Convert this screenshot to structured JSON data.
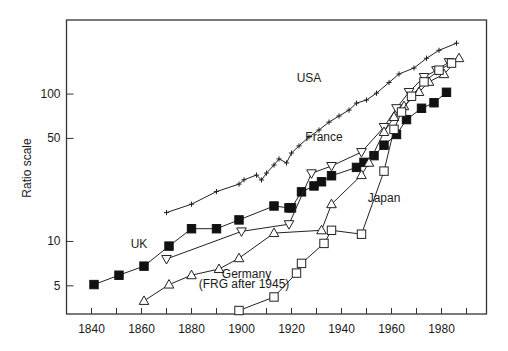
{
  "chart_data": {
    "type": "line",
    "title": "",
    "xlabel": "",
    "ylabel": "Ratio scale",
    "yscale": "log",
    "xlim": [
      1830,
      1998
    ],
    "ylim": [
      3.22,
      318
    ],
    "grid": false,
    "legend": "none (inline series labels)",
    "xticks": [
      1840,
      1860,
      1880,
      1900,
      1920,
      1940,
      1960,
      1980
    ],
    "xminor_step": 10,
    "yticks": [
      5,
      10,
      50,
      100
    ],
    "series": [
      {
        "name": "USA",
        "label": "USA",
        "marker": "cross",
        "points": [
          [
            1870,
            15.7
          ],
          [
            1880,
            17.9
          ],
          [
            1890,
            21.8
          ],
          [
            1899,
            24.5
          ],
          [
            1901,
            26.2
          ],
          [
            1906,
            28.2
          ],
          [
            1908,
            26.1
          ],
          [
            1910,
            29.1
          ],
          [
            1913,
            33.0
          ],
          [
            1915,
            36.3
          ],
          [
            1918,
            34.1
          ],
          [
            1920,
            39.8
          ],
          [
            1923,
            44.5
          ],
          [
            1927,
            51.1
          ],
          [
            1931,
            57.0
          ],
          [
            1935,
            64.5
          ],
          [
            1939,
            71.0
          ],
          [
            1943,
            77.8
          ],
          [
            1946,
            86.8
          ],
          [
            1950,
            91.1
          ],
          [
            1954,
            101.4
          ],
          [
            1959,
            119.8
          ],
          [
            1963,
            136.8
          ],
          [
            1969,
            150.2
          ],
          [
            1974,
            174.9
          ],
          [
            1979,
            198.0
          ],
          [
            1986,
            221.4
          ]
        ]
      },
      {
        "name": "UK",
        "label": "UK",
        "marker": "filled-square",
        "points": [
          [
            1841,
            5.1
          ],
          [
            1851,
            5.9
          ],
          [
            1861,
            6.8
          ],
          [
            1871,
            9.3
          ],
          [
            1880,
            12.2
          ],
          [
            1890,
            12.2
          ],
          [
            1899,
            14.0
          ],
          [
            1913,
            17.4
          ],
          [
            1919,
            16.9
          ],
          [
            1920,
            16.9
          ],
          [
            1924,
            21.7
          ],
          [
            1929,
            23.8
          ],
          [
            1932,
            25.4
          ],
          [
            1936,
            27.9
          ],
          [
            1946,
            31.8
          ],
          [
            1949,
            34.4
          ],
          [
            1953,
            38.2
          ],
          [
            1957,
            45.0
          ],
          [
            1962,
            53.2
          ],
          [
            1966,
            67.1
          ],
          [
            1972,
            80.1
          ],
          [
            1977,
            87.3
          ],
          [
            1982,
            102.8
          ]
        ]
      },
      {
        "name": "France",
        "label": "France",
        "marker": "open-down-triangle",
        "points": [
          [
            1870,
            7.6
          ],
          [
            1900,
            11.7
          ],
          [
            1919,
            13.1
          ],
          [
            1928,
            29.0
          ],
          [
            1936,
            32.5
          ],
          [
            1948,
            40.4
          ],
          [
            1957,
            59.8
          ],
          [
            1962,
            80.2
          ],
          [
            1967,
            103.3
          ],
          [
            1973,
            130.5
          ],
          [
            1978,
            145.2
          ],
          [
            1983,
            164.7
          ]
        ]
      },
      {
        "name": "Germany",
        "label": "Germany",
        "label2": "(FRG after 1945)",
        "marker": "open-up-triangle",
        "points": [
          [
            1861,
            3.95
          ],
          [
            1871,
            5.1
          ],
          [
            1880,
            5.9
          ],
          [
            1891,
            6.5
          ],
          [
            1899,
            7.7
          ],
          [
            1913,
            11.4
          ],
          [
            1932,
            11.9
          ],
          [
            1936,
            17.9
          ],
          [
            1948,
            28.2
          ],
          [
            1951,
            34.2
          ],
          [
            1957,
            55.3
          ],
          [
            1961,
            69.9
          ],
          [
            1965,
            82.8
          ],
          [
            1971,
            103.3
          ],
          [
            1975,
            121.0
          ],
          [
            1981,
            136.5
          ],
          [
            1987,
            175.2
          ]
        ]
      },
      {
        "name": "Japan",
        "label": "Japan",
        "marker": "open-square",
        "points": [
          [
            1899,
            3.4
          ],
          [
            1913,
            4.2
          ],
          [
            1922,
            6.1
          ],
          [
            1924,
            7.1
          ],
          [
            1933,
            9.7
          ],
          [
            1936,
            11.9
          ],
          [
            1948,
            11.2
          ],
          [
            1957,
            30.0
          ],
          [
            1961,
            57.6
          ],
          [
            1964,
            75.5
          ],
          [
            1968,
            96.6
          ],
          [
            1973,
            121.0
          ],
          [
            1979,
            145.2
          ],
          [
            1984,
            162.2
          ]
        ]
      }
    ],
    "annotations": [
      {
        "text": "USA",
        "at": [
          1927,
          120
        ]
      },
      {
        "text": "France",
        "at": [
          1933,
          48
        ]
      },
      {
        "text": "UK",
        "at": [
          1859,
          9.0
        ]
      },
      {
        "text": "Japan",
        "at": [
          1957,
          18.5
        ]
      },
      {
        "text": "Germany",
        "at": [
          1902,
          5.65
        ]
      },
      {
        "text": "(FRG after 1945)",
        "at": [
          1901,
          4.8
        ]
      }
    ]
  }
}
